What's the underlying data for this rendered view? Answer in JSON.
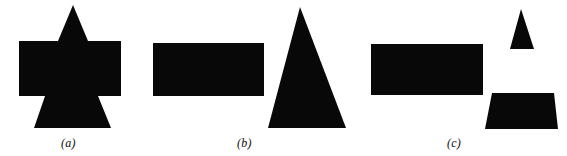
{
  "figure": {
    "background_color": "#ffffff",
    "ink_color": "#080808",
    "width": 567,
    "height": 156,
    "panels": [
      {
        "id": "panel-a",
        "caption": "(a)",
        "caption_x": 61,
        "caption_y": 137,
        "description": "single fused silhouette: upward triangle on top of a wide rectangle with a downward-flaring trapezoid below",
        "shapes": [
          {
            "name": "triangle-top",
            "type": "polygon",
            "points": "73,5 88,41 58,41"
          },
          {
            "name": "rectangle-body",
            "type": "polygon",
            "points": "19,41 121,41 121,96 19,96"
          },
          {
            "name": "trapezoid-bottom",
            "type": "polygon",
            "points": "45,96 98,96 111,128 34,128"
          }
        ]
      },
      {
        "id": "panel-b",
        "caption": "(b)",
        "caption_x": 237,
        "caption_y": 137,
        "description": "rectangle separated from a large upward triangle",
        "shapes": [
          {
            "name": "rectangle",
            "type": "polygon",
            "points": "153,43 264,43 264,96 153,96"
          },
          {
            "name": "triangle-large",
            "type": "polygon",
            "points": "300,7 346,128 268,128"
          }
        ]
      },
      {
        "id": "panel-c",
        "caption": "(c)",
        "caption_x": 447,
        "caption_y": 137,
        "description": "rectangle, small upward triangle, and a flaring trapezoid all separated",
        "shapes": [
          {
            "name": "rectangle",
            "type": "polygon",
            "points": "371,44 483,44 483,95 371,95"
          },
          {
            "name": "triangle-small",
            "type": "polygon",
            "points": "521,9 534,49 510,49"
          },
          {
            "name": "trapezoid",
            "type": "polygon",
            "points": "492,93 554,93 558,129 485,129"
          }
        ]
      }
    ]
  }
}
